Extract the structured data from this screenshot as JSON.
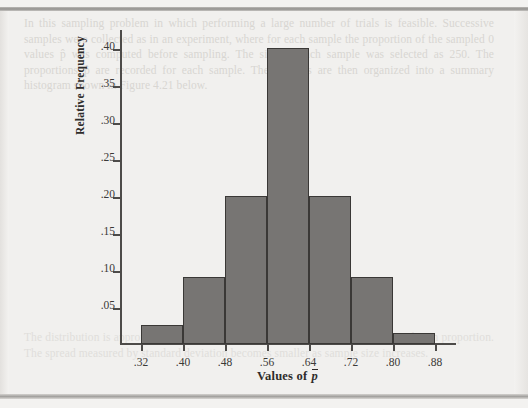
{
  "page": {
    "ghost_text_top": "In this sampling problem in which performing a large number of trials is feasible. Successive samples were collected as in an experiment, where for each sample the proportion of the sampled 0 values p̂ was computed before sampling. The size of each sample was selected as 250. The proportions p̂ are recorded for each sample. Their values are then organized into a summary histogram shown in Figure 4.21 below.",
    "ghost_text_mid": "",
    "ghost_text_bottom": "The distribution is approximately symmetric and centered at the value of the population proportion. The spread measured by standard deviation becomes smaller as sample size increases."
  },
  "chart_data": {
    "type": "bar",
    "title": "",
    "xlabel": "Values of p̄",
    "ylabel": "Relative Frequency",
    "categories": [
      "0.32-0.40",
      "0.40-0.48",
      "0.48-0.56",
      "0.56-0.64",
      "0.64-0.72",
      "0.72-0.80",
      "0.80-0.88"
    ],
    "bin_edges": [
      0.32,
      0.4,
      0.48,
      0.56,
      0.64,
      0.72,
      0.8,
      0.88
    ],
    "values": [
      0.025,
      0.09,
      0.2,
      0.4,
      0.2,
      0.09,
      0.015
    ],
    "xlim": [
      0.28,
      0.92
    ],
    "ylim": [
      0,
      0.425
    ],
    "xticks": [
      0.32,
      0.4,
      0.48,
      0.56,
      0.64,
      0.72,
      0.8,
      0.88
    ],
    "xtick_labels": [
      ".32",
      ".40",
      ".48",
      ".56",
      ".64",
      ".72",
      ".80",
      ".88"
    ],
    "yticks": [
      0.05,
      0.1,
      0.15,
      0.2,
      0.25,
      0.3,
      0.35,
      0.4
    ],
    "ytick_labels": [
      ".05",
      ".10",
      ".15",
      ".20",
      ".25",
      ".30",
      ".35",
      ".40"
    ],
    "grid": false,
    "legend": null,
    "bar_color": "#777573",
    "bar_edge_color": "#3a3836",
    "axis_color": "#4d4b49",
    "background_color": "#f1f0ee"
  }
}
